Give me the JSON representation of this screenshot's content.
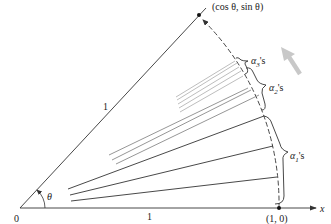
{
  "figure": {
    "labels": {
      "top_point": "(cos  θ,  sin  θ)",
      "one_point": "(1,  0)",
      "origin": "0",
      "x_axis": "x",
      "radius_label": "1",
      "base_label": "1",
      "theta": "θ",
      "alpha1": "α",
      "alpha1_sub": "1",
      "alpha1_suffix": "'s",
      "alpha2": "α",
      "alpha2_sub": "2",
      "alpha2_suffix": "'s",
      "alpha3": "α",
      "alpha3_sub": "3",
      "alpha3_suffix": "'s"
    },
    "colors": {
      "line_dark": "#333333",
      "line_mid": "#8a8a8a",
      "line_light": "#b5b5b5",
      "arrow_gray": "#c8c8c8"
    }
  }
}
